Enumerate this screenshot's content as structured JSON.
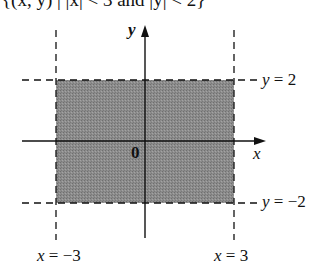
{
  "caption": "{(x, y) | |x| < 3 and |y| < 2}",
  "axes": {
    "x_label": "x",
    "y_label": "y",
    "origin_label": "0"
  },
  "boundaries": {
    "top": {
      "var": "y",
      "eq": " = 2"
    },
    "bottom": {
      "var": "y",
      "eq": " = −2"
    },
    "left": {
      "var": "x",
      "eq": " = −3"
    },
    "right": {
      "var": "x",
      "eq": " = 3"
    }
  },
  "region": {
    "description": "shaded rectangle |x| < 3, |y| < 2",
    "fill": "#8a8a8a",
    "line_color": "#111111"
  }
}
